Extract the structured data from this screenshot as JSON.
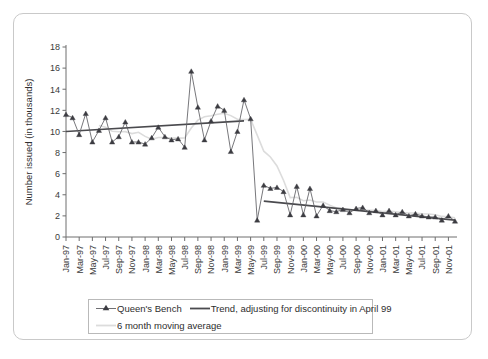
{
  "chart_data": {
    "type": "line",
    "title": "",
    "xlabel": "",
    "ylabel": "Number issued (in thousands)",
    "ylim": [
      0,
      18
    ],
    "yticks": [
      0,
      2,
      4,
      6,
      8,
      10,
      12,
      14,
      16,
      18
    ],
    "ytick_labels": [
      "0",
      "2",
      "4",
      "6",
      "8",
      "10",
      "12",
      "14",
      "16",
      "18"
    ],
    "grid": false,
    "legend_position": "bottom",
    "annotation": "Discontinuity in April 99",
    "x": [
      "Jan-97",
      "Feb-97",
      "Mar-97",
      "Apr-97",
      "May-97",
      "Jun-97",
      "Jul-97",
      "Aug-97",
      "Sep-97",
      "Oct-97",
      "Nov-97",
      "Dec-97",
      "Jan-98",
      "Feb-98",
      "Mar-98",
      "Apr-98",
      "May-98",
      "Jun-98",
      "Jul-98",
      "Aug-98",
      "Sep-98",
      "Oct-98",
      "Nov-98",
      "Dec-98",
      "Jan-99",
      "Feb-99",
      "Mar-99",
      "Apr-99",
      "May-99",
      "Jun-99",
      "Jul-99",
      "Aug-99",
      "Sep-99",
      "Oct-99",
      "Nov-99",
      "Dec-99",
      "Jan-00",
      "Feb-00",
      "Mar-00",
      "Apr-00",
      "May-00",
      "Jun-00",
      "Jul-00",
      "Aug-00",
      "Sep-00",
      "Oct-00",
      "Nov-00",
      "Dec-00",
      "Jan-01",
      "Feb-01",
      "Mar-01",
      "Apr-01",
      "May-01",
      "Jun-01",
      "Jul-01",
      "Aug-01",
      "Sep-01",
      "Oct-01",
      "Nov-01",
      "Dec-01"
    ],
    "xtick_labels": [
      "Jan-97",
      "Mar-97",
      "May-97",
      "Jul-97",
      "Sep-97",
      "Nov-97",
      "Jan-98",
      "Mar-98",
      "May-98",
      "Jul-98",
      "Sep-98",
      "Nov-98",
      "Jan-99",
      "Mar-99",
      "May-99",
      "Jul-99",
      "Sep-99",
      "Nov-99",
      "Jan-00",
      "Mar-00",
      "May-00",
      "Jul-00",
      "Sep-00",
      "Nov-00",
      "Jan-01",
      "Mar-01",
      "May-01",
      "Jul-01",
      "Sep-01",
      "Nov-01"
    ],
    "series": [
      {
        "name": "Queen's Bench",
        "style": "line-markers",
        "marker": "triangle",
        "color": "#3c3c42",
        "values": [
          11.6,
          11.3,
          9.7,
          11.7,
          9.0,
          10.1,
          11.3,
          9.0,
          9.5,
          10.9,
          9.0,
          9.0,
          8.8,
          9.4,
          10.4,
          9.5,
          9.2,
          9.3,
          8.5,
          15.7,
          12.3,
          9.2,
          11.0,
          12.4,
          12.0,
          8.1,
          10.0,
          13.0,
          11.2,
          1.6,
          4.9,
          4.6,
          4.7,
          4.3,
          2.1,
          4.8,
          2.1,
          4.6,
          2.0,
          3.0,
          2.5,
          2.4,
          2.6,
          2.3,
          2.7,
          2.8,
          2.3,
          2.5,
          2.1,
          2.5,
          2.1,
          2.4,
          2.0,
          2.2,
          2.0,
          1.9,
          1.9,
          1.6,
          2.0,
          1.5
        ]
      },
      {
        "name": "Trend, adjusting for discontinuity in April 99",
        "style": "line",
        "color": "#4a4a4e",
        "segments": [
          {
            "x_start": "Jan-97",
            "x_end": "Apr-99",
            "y_start": 10.0,
            "y_end": 11.0
          },
          {
            "x_start": "Jul-99",
            "x_end": "Dec-01",
            "y_start": 3.4,
            "y_end": 1.6
          }
        ]
      },
      {
        "name": "6 month moving average",
        "style": "line",
        "color": "#dcdcdc",
        "values": [
          null,
          null,
          null,
          null,
          null,
          10.57,
          10.4,
          10.02,
          9.97,
          9.98,
          9.8,
          9.92,
          9.53,
          9.27,
          9.43,
          9.43,
          9.38,
          9.37,
          9.38,
          10.33,
          11.07,
          11.4,
          11.48,
          11.63,
          11.72,
          11.5,
          11.15,
          11.12,
          11.15,
          9.65,
          8.13,
          7.58,
          6.73,
          5.35,
          3.73,
          3.77,
          3.43,
          3.5,
          3.32,
          3.32,
          3.02,
          2.75,
          2.73,
          2.43,
          2.58,
          2.55,
          2.52,
          2.53,
          2.42,
          2.45,
          2.38,
          2.32,
          2.27,
          2.27,
          2.2,
          2.18,
          2.1,
          1.95,
          1.92,
          1.82
        ]
      }
    ]
  },
  "legend": {
    "entries": [
      {
        "label": "Queen's Bench",
        "key": "triangle-marker-key"
      },
      {
        "label": "Trend, adjusting for discontinuity in April 99",
        "key": "solid-line-key"
      },
      {
        "label": "6 month moving average",
        "key": "light-line-key"
      }
    ]
  },
  "axes": {
    "y_axis_label": "Number issued (in thousands)"
  }
}
